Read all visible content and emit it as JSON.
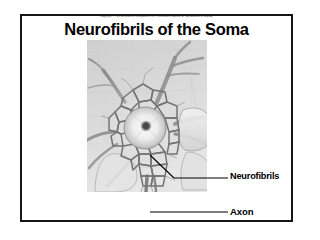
{
  "slide": {
    "copyright": "Copyright © The McGraw-Hill Companies, Inc. Permission required for reproduction or display.",
    "title": "Neurofibrils of the Soma",
    "border_color": "#15151a",
    "background_color": "#ffffff"
  },
  "figure": {
    "name": "neuron-soma-illustration",
    "style": "grayscale-pencil-sketch",
    "tones": {
      "paper": "#d8d8d8",
      "fibril_dark": "#6b6b6b",
      "fibril_mid": "#8d8d8d",
      "nucleus_light": "#efefef",
      "nucleolus": "#3a3a3a"
    }
  },
  "callouts": [
    {
      "id": "neurofibrils",
      "label": "Neurofibrils",
      "leader": "diagonal"
    },
    {
      "id": "axon",
      "label": "Axon",
      "leader": "horizontal"
    }
  ]
}
